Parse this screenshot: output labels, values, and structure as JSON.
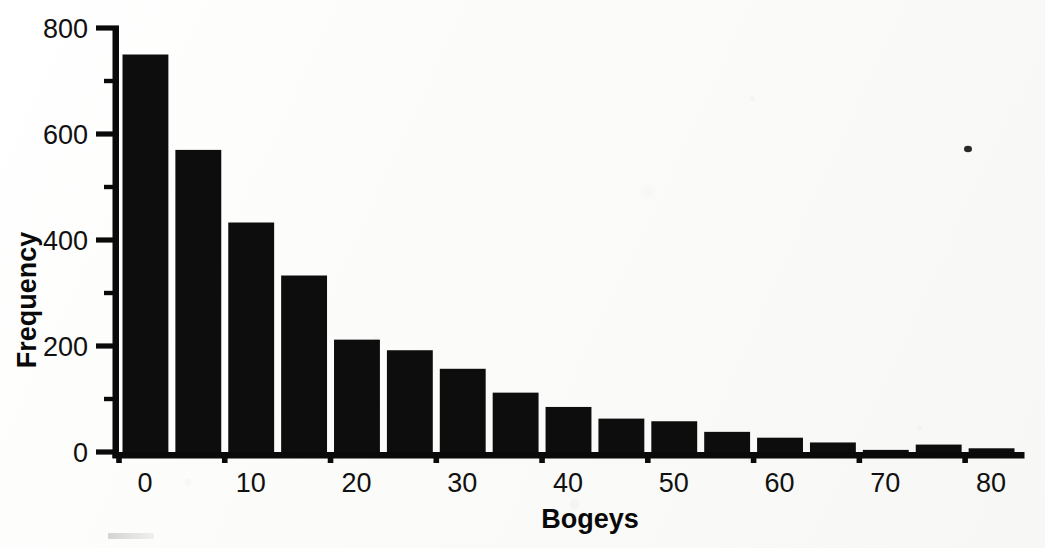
{
  "figure": {
    "kind": "histogram",
    "background_color": "#fdfdfc",
    "ink_color": "#0d0d0d"
  },
  "chart_data": {
    "type": "bar",
    "title": "",
    "subtitle": "",
    "xlabel": "Bogeys",
    "ylabel": "Frequency",
    "categories": [
      "0-5",
      "5-10",
      "10-15",
      "15-20",
      "20-25",
      "25-30",
      "30-35",
      "35-40",
      "40-45",
      "45-50",
      "50-55",
      "55-60",
      "60-65",
      "65-70",
      "70-75",
      "75-80",
      "80-85"
    ],
    "bin_starts": [
      0,
      5,
      10,
      15,
      20,
      25,
      30,
      35,
      40,
      45,
      50,
      55,
      60,
      65,
      70,
      75,
      80
    ],
    "bin_width": 5,
    "values": [
      750,
      570,
      433,
      333,
      212,
      192,
      157,
      112,
      85,
      63,
      58,
      38,
      27,
      18,
      4,
      14,
      7
    ],
    "xlim": [
      0,
      85
    ],
    "ylim": [
      0,
      800
    ],
    "x_major_ticks": [
      0,
      10,
      20,
      30,
      40,
      50,
      60,
      70,
      80
    ],
    "x_tick_labels": [
      "0",
      "10",
      "20",
      "30",
      "40",
      "50",
      "60",
      "70",
      "80"
    ],
    "x_minor_ticks": [
      5,
      15,
      25,
      35,
      45,
      55,
      65,
      75,
      85
    ],
    "y_major_ticks": [
      0,
      200,
      400,
      600,
      800
    ],
    "y_tick_labels": [
      "0",
      "200",
      "400",
      "600",
      "800"
    ],
    "y_minor_ticks": [
      100,
      300,
      500,
      700
    ],
    "grid": false,
    "legend": false,
    "legend_position": "none",
    "bar_color": "#0d0d0d",
    "annotations": []
  },
  "axes": {
    "y_axis_title": "Frequency",
    "x_axis_title": "Bogeys",
    "y_labels": [
      "800",
      "600",
      "400",
      "200",
      "0"
    ],
    "x_labels": [
      "0",
      "10",
      "20",
      "30",
      "40",
      "50",
      "60",
      "70",
      "80"
    ]
  },
  "artifacts": {
    "scan_speck_label": "scan-speck"
  }
}
